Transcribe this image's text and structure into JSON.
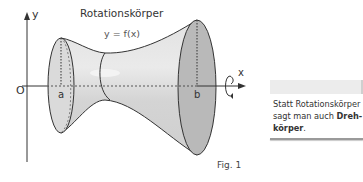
{
  "figure": {
    "title": "Rotationskörper",
    "curve_label": "y = f(x)",
    "axis_y_label": "y",
    "axis_x_label": "x",
    "origin_label": "O",
    "bound_a_label": "a",
    "bound_b_label": "b",
    "caption": "Fig. 1",
    "colors": {
      "body_fill": "#d6d6d6",
      "end_face_fill": "#b9b9b9",
      "outline": "#333333"
    }
  },
  "note": {
    "text_part1": "Statt Rotationskörper",
    "text_part2": "sagt man auch ",
    "bold_part1": "Dreh-",
    "bold_part2": "körper",
    "trailing": "."
  }
}
